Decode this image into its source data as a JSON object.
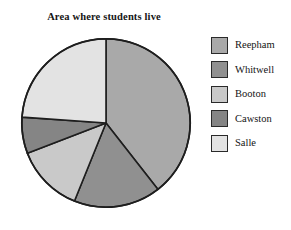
{
  "chart_data": {
    "type": "pie",
    "title": "Area where students live",
    "xlabel": "",
    "ylabel": "",
    "legend_position": "right",
    "grid": false,
    "start_angle_deg": 0,
    "direction": "clockwise",
    "categories": [
      "Reepham",
      "Whitwell",
      "Booton",
      "Cawston",
      "Salle"
    ],
    "values": [
      39.4,
      16.7,
      13.1,
      6.9,
      23.9
    ],
    "units": "percent",
    "slice_angles_deg": [
      142,
      60,
      47,
      25,
      86
    ],
    "colors": [
      "#a9a9a9",
      "#909090",
      "#c9c9c9",
      "#858585",
      "#e3e3e3"
    ],
    "outline_color": "#1e1e1e",
    "slices": [
      {
        "label": "Reepham",
        "value": 39.4,
        "angle_deg": 142,
        "color": "#a9a9a9"
      },
      {
        "label": "Whitwell",
        "value": 16.7,
        "angle_deg": 60,
        "color": "#909090"
      },
      {
        "label": "Booton",
        "value": 13.1,
        "angle_deg": 47,
        "color": "#c9c9c9"
      },
      {
        "label": "Cawston",
        "value": 6.9,
        "angle_deg": 25,
        "color": "#858585"
      },
      {
        "label": "Salle",
        "value": 23.9,
        "angle_deg": 86,
        "color": "#e3e3e3"
      }
    ]
  },
  "legend": {
    "items": [
      {
        "label": "Reepham",
        "color": "#a9a9a9"
      },
      {
        "label": "Whitwell",
        "color": "#909090"
      },
      {
        "label": "Booton",
        "color": "#c9c9c9"
      },
      {
        "label": "Cawston",
        "color": "#858585"
      },
      {
        "label": "Salle",
        "color": "#e3e3e3"
      }
    ]
  }
}
